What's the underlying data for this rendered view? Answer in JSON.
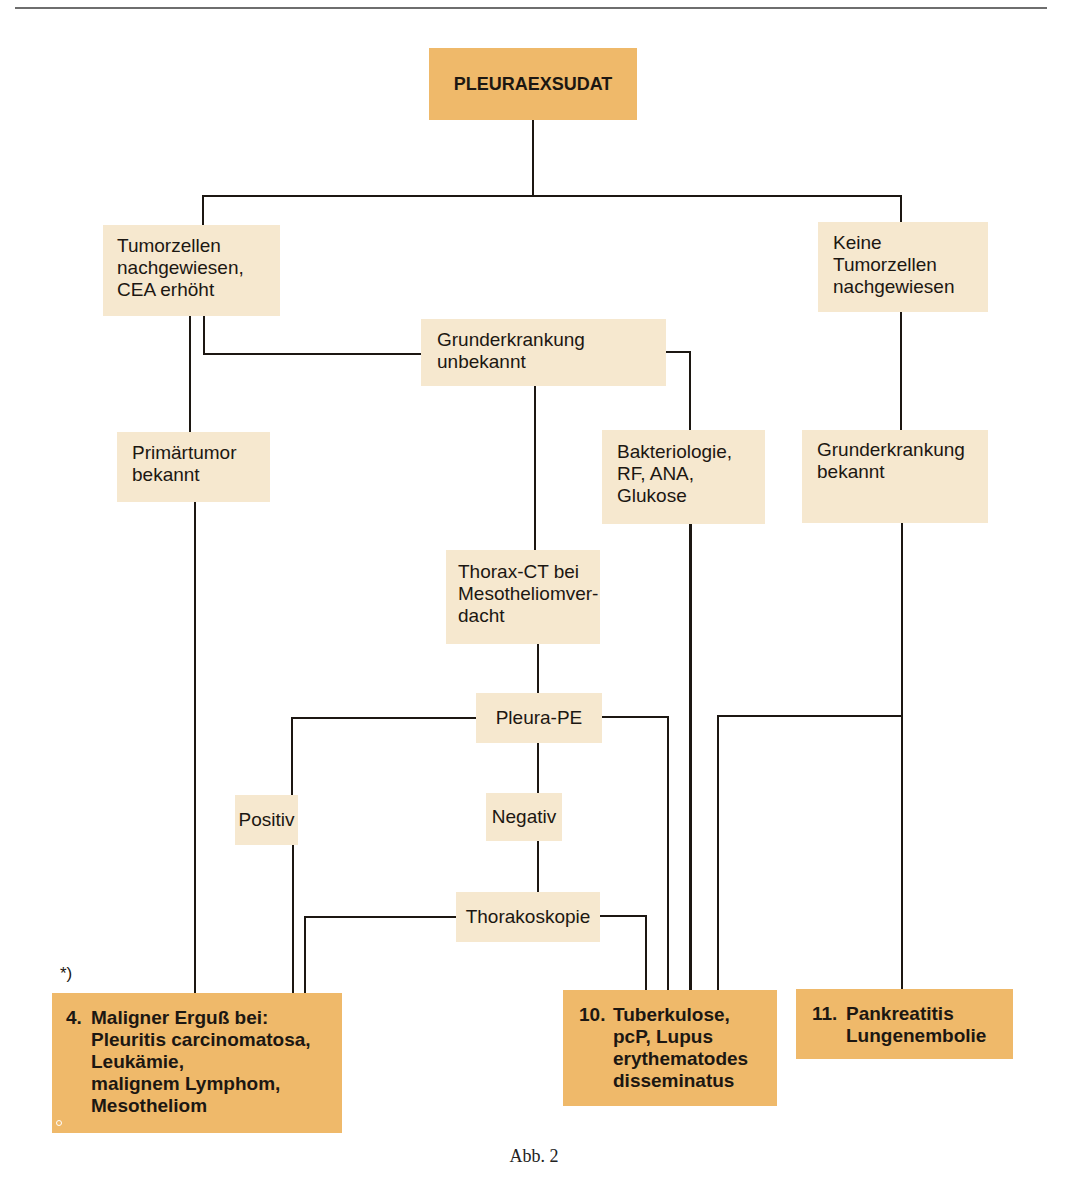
{
  "header": {
    "rule": true
  },
  "diagram": {
    "type": "flowchart",
    "root": {
      "id": "pleuraexsudat",
      "label": "PLEURAEXSUDAT"
    },
    "nodes": {
      "tumorzellen": {
        "lines": [
          "Tumorzellen",
          "nachgewiesen,",
          "CEA erhöht"
        ]
      },
      "keine_tumorzellen": {
        "lines": [
          "Keine",
          "Tumorzellen",
          "nachgewiesen"
        ]
      },
      "grunderkrankung_unbekannt": {
        "lines": [
          "Grunderkrankung",
          "unbekannt"
        ]
      },
      "primaertumor": {
        "lines": [
          "Primärtumor",
          "bekannt"
        ]
      },
      "bakteriologie": {
        "lines": [
          "Bakteriologie,",
          "RF, ANA,",
          "Glukose"
        ]
      },
      "grunderkrankung_bekannt": {
        "lines": [
          "Grunderkrankung",
          "bekannt"
        ]
      },
      "thorax_ct": {
        "lines": [
          "Thorax-CT bei",
          "Mesotheliomver-",
          "dacht"
        ]
      },
      "pleura_pe": {
        "label": "Pleura-PE"
      },
      "positiv": {
        "label": "Positiv"
      },
      "negativ": {
        "label": "Negativ"
      },
      "thorakoskopie": {
        "label": "Thorakoskopie"
      }
    },
    "outcomes": {
      "maligner": {
        "number": "4.",
        "lines": [
          "Maligner Erguß bei:",
          "Pleuritis carcinomatosa,",
          "Leukämie,",
          "malignem Lymphom,",
          "Mesotheliom"
        ]
      },
      "tuberkulose": {
        "number": "10.",
        "lines": [
          "Tuberkulose,",
          "pcP, Lupus",
          "erythematodes",
          "disseminatus"
        ]
      },
      "pankreatitis": {
        "number": "11.",
        "lines": [
          "Pankreatitis",
          "Lungenembolie"
        ]
      }
    },
    "edges": [
      [
        "PLEURAEXSUDAT",
        "Tumorzellen nachgewiesen, CEA erhöht"
      ],
      [
        "PLEURAEXSUDAT",
        "Keine Tumorzellen nachgewiesen"
      ],
      [
        "Tumorzellen nachgewiesen, CEA erhöht",
        "Grunderkrankung unbekannt"
      ],
      [
        "Tumorzellen nachgewiesen, CEA erhöht",
        "Primärtumor bekannt"
      ],
      [
        "Primärtumor bekannt",
        "4. Maligner Erguß"
      ],
      [
        "Grunderkrankung unbekannt",
        "Thorax-CT bei Mesotheliomverdacht"
      ],
      [
        "Grunderkrankung unbekannt",
        "10. Tuberkulose"
      ],
      [
        "Keine Tumorzellen nachgewiesen",
        "Bakteriologie, RF, ANA, Glukose"
      ],
      [
        "Keine Tumorzellen nachgewiesen",
        "Grunderkrankung bekannt"
      ],
      [
        "Bakteriologie, RF, ANA, Glukose",
        "10. Tuberkulose"
      ],
      [
        "Grunderkrankung bekannt",
        "10. Tuberkulose"
      ],
      [
        "Grunderkrankung bekannt",
        "11. Pankreatitis"
      ],
      [
        "Thorax-CT bei Mesotheliomverdacht",
        "Pleura-PE"
      ],
      [
        "Pleura-PE",
        "Positiv"
      ],
      [
        "Pleura-PE",
        "Negativ"
      ],
      [
        "Pleura-PE",
        "10. Tuberkulose"
      ],
      [
        "Positiv",
        "4. Maligner Erguß"
      ],
      [
        "Negativ",
        "Thorakoskopie"
      ],
      [
        "Thorakoskopie",
        "4. Maligner Erguß"
      ],
      [
        "Thorakoskopie",
        "10. Tuberkulose"
      ]
    ],
    "colors": {
      "light_box": "#f6e8cf",
      "dark_box": "#efb96a",
      "line": "#1c1712",
      "rule": "#6e6e6e"
    }
  },
  "footnote": "*)",
  "caption": "Abb. 2"
}
